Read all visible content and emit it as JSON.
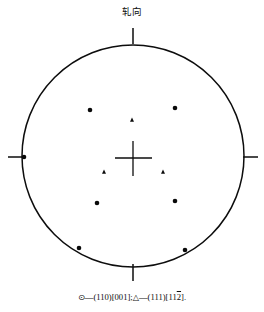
{
  "figure": {
    "type": "pole-figure",
    "top_axis_label": "轧向",
    "caption_parts": {
      "open_circle_symbol": "⊙",
      "dash": "—",
      "orientation_1": "(110)[001]",
      "separator": ";",
      "triangle_symbol": "△",
      "orientation_2_prefix": "(111)[11",
      "orientation_2_bar": "2",
      "orientation_2_suffix": "]",
      "period": "."
    },
    "caption_text": "⊙—(110)[001];△—(111)[112̅]."
  },
  "chart_data": {
    "type": "scatter",
    "title": "",
    "subtitle": "",
    "xlabel": "",
    "ylabel": "",
    "annotations": [
      {
        "text": "轧向",
        "position": "top",
        "x": 133,
        "y": 15
      }
    ],
    "grid": false,
    "legend_position": "below",
    "projection": {
      "outline": "circle",
      "center_x": 133,
      "center_y": 156,
      "radius": 111,
      "center_marker": "cross",
      "edge_ticks": [
        "top",
        "left",
        "right",
        "bottom"
      ]
    },
    "legend": [
      {
        "marker": "circle",
        "symbol": "⊙",
        "label": "(110)[001]"
      },
      {
        "marker": "triangle",
        "symbol": "△",
        "label": "(111)[112̅]"
      }
    ],
    "series": [
      {
        "name": "(110)[001]",
        "marker": "circle",
        "color": "#0a0a0a",
        "points": [
          {
            "x": 90,
            "y": 110
          },
          {
            "x": 175,
            "y": 108
          },
          {
            "x": 97,
            "y": 203
          },
          {
            "x": 175,
            "y": 201
          },
          {
            "x": 24,
            "y": 157
          },
          {
            "x": 79,
            "y": 248
          },
          {
            "x": 185,
            "y": 250
          }
        ]
      },
      {
        "name": "(111)[112̅]",
        "marker": "triangle",
        "color": "#0a0a0a",
        "points": [
          {
            "x": 132,
            "y": 120
          },
          {
            "x": 104,
            "y": 172
          },
          {
            "x": 163,
            "y": 172
          }
        ]
      }
    ]
  }
}
